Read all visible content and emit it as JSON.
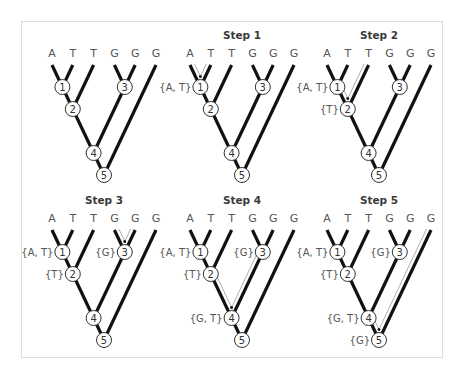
{
  "figure": {
    "leaves": [
      "A",
      "T",
      "T",
      "G",
      "G",
      "G"
    ],
    "nodes": [
      {
        "id": 1,
        "label": "1",
        "children": [
          "L0",
          "L1"
        ]
      },
      {
        "id": 2,
        "label": "2",
        "children": [
          "N1",
          "L2"
        ]
      },
      {
        "id": 3,
        "label": "3",
        "children": [
          "L3",
          "L4"
        ]
      },
      {
        "id": 4,
        "label": "4",
        "children": [
          "N2",
          "N3"
        ]
      },
      {
        "id": 5,
        "label": "5",
        "children": [
          "N4",
          "L5"
        ]
      }
    ],
    "panels": [
      {
        "title": "",
        "sets": {},
        "arrows": []
      },
      {
        "title": "Step 1",
        "sets": {
          "1": "{A, T}"
        },
        "arrows": [
          {
            "from": "L0",
            "to": "N1"
          },
          {
            "from": "L1",
            "to": "N1"
          }
        ]
      },
      {
        "title": "Step 2",
        "sets": {
          "1": "{A, T}",
          "2": "{T}"
        },
        "arrows": [
          {
            "from": "N1",
            "to": "N2"
          },
          {
            "from": "L2",
            "to": "N2"
          }
        ]
      },
      {
        "title": "Step 3",
        "sets": {
          "1": "{A, T}",
          "2": "{T}",
          "3": "{G}"
        },
        "arrows": [
          {
            "from": "L3",
            "to": "N3"
          },
          {
            "from": "L4",
            "to": "N3"
          }
        ]
      },
      {
        "title": "Step 4",
        "sets": {
          "1": "{A, T}",
          "2": "{T}",
          "3": "{G}",
          "4": "{G, T}"
        },
        "arrows": [
          {
            "from": "N2",
            "to": "N4"
          },
          {
            "from": "N3",
            "to": "N4"
          }
        ]
      },
      {
        "title": "Step 5",
        "sets": {
          "1": "{A, T}",
          "2": "{T}",
          "3": "{G}",
          "4": "{G, T}",
          "5": "{G}"
        },
        "arrows": [
          {
            "from": "N4",
            "to": "N5"
          },
          {
            "from": "L5",
            "to": "N5"
          }
        ]
      }
    ]
  }
}
